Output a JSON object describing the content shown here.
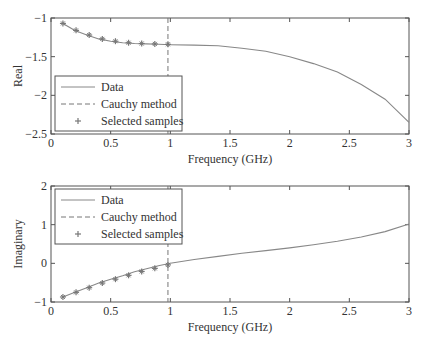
{
  "chart_data": [
    {
      "type": "line",
      "title": "",
      "xlabel": "Frequency (GHz)",
      "ylabel": "Real",
      "xlim": [
        0,
        3
      ],
      "ylim": [
        -2.5,
        -1
      ],
      "xticks": [
        "0",
        "0.5",
        "1",
        "1.5",
        "2",
        "2.5",
        "3"
      ],
      "yticks": [
        "-1",
        "-1.5",
        "-2",
        "-2.5"
      ],
      "legend": [
        "Data",
        "Cauchy method",
        "Selected samples"
      ],
      "legend_position": "lower left",
      "cauchy_x": 0.98,
      "series": [
        {
          "name": "Data",
          "x": [
            0.1,
            0.2,
            0.3,
            0.4,
            0.5,
            0.6,
            0.7,
            0.8,
            0.9,
            1.0,
            1.2,
            1.4,
            1.6,
            1.8,
            2.0,
            2.2,
            2.4,
            2.6,
            2.8,
            3.0
          ],
          "values": [
            -1.07,
            -1.16,
            -1.22,
            -1.27,
            -1.3,
            -1.32,
            -1.33,
            -1.335,
            -1.34,
            -1.345,
            -1.35,
            -1.36,
            -1.39,
            -1.43,
            -1.5,
            -1.59,
            -1.7,
            -1.86,
            -2.05,
            -2.35
          ]
        },
        {
          "name": "Selected samples",
          "x": [
            0.1,
            0.21,
            0.32,
            0.43,
            0.54,
            0.65,
            0.76,
            0.87,
            0.98
          ],
          "values": [
            -1.07,
            -1.16,
            -1.22,
            -1.27,
            -1.3,
            -1.32,
            -1.33,
            -1.335,
            -1.34
          ]
        }
      ]
    },
    {
      "type": "line",
      "title": "",
      "xlabel": "Frequency (GHz)",
      "ylabel": "Imaginary",
      "xlim": [
        0,
        3
      ],
      "ylim": [
        -1,
        2
      ],
      "xticks": [
        "0",
        "0.5",
        "1",
        "1.5",
        "2",
        "2.5",
        "3"
      ],
      "yticks": [
        "2",
        "1",
        "0",
        "-1"
      ],
      "legend": [
        "Data",
        "Cauchy method",
        "Selected samples"
      ],
      "legend_position": "upper left",
      "cauchy_x": 0.98,
      "series": [
        {
          "name": "Data",
          "x": [
            0.1,
            0.2,
            0.3,
            0.4,
            0.5,
            0.6,
            0.7,
            0.8,
            0.9,
            1.0,
            1.2,
            1.4,
            1.6,
            1.8,
            2.0,
            2.2,
            2.4,
            2.6,
            2.8,
            3.0
          ],
          "values": [
            -0.87,
            -0.75,
            -0.63,
            -0.51,
            -0.41,
            -0.32,
            -0.22,
            -0.14,
            -0.06,
            0.0,
            0.1,
            0.18,
            0.26,
            0.33,
            0.4,
            0.48,
            0.57,
            0.68,
            0.82,
            1.02
          ]
        },
        {
          "name": "Selected samples",
          "x": [
            0.1,
            0.21,
            0.32,
            0.43,
            0.54,
            0.65,
            0.76,
            0.87,
            0.98
          ],
          "values": [
            -0.87,
            -0.75,
            -0.63,
            -0.51,
            -0.41,
            -0.31,
            -0.21,
            -0.13,
            -0.04
          ]
        }
      ]
    }
  ]
}
